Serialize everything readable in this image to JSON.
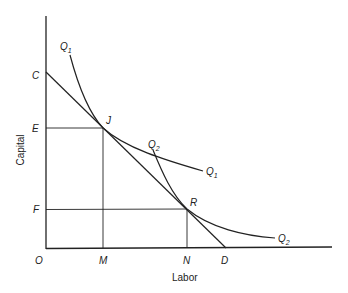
{
  "diagram": {
    "type": "isoquant-isocost",
    "axes": {
      "x_label": "Labor",
      "y_label": "Capital",
      "origin_label": "O"
    },
    "points": {
      "J": "J",
      "R": "R",
      "C": "C",
      "D": "D",
      "E": "E",
      "F": "F",
      "M": "M",
      "N": "N"
    },
    "curves": {
      "q1": {
        "main": "Q",
        "sub": "1"
      },
      "q2": {
        "main": "Q",
        "sub": "2"
      }
    },
    "lines": [
      {
        "name": "isocost-CD",
        "from": "C",
        "to": "D"
      },
      {
        "name": "tangent-at-R",
        "through": "R"
      }
    ],
    "colors": {
      "stroke": "#222222",
      "background": "#ffffff"
    }
  }
}
